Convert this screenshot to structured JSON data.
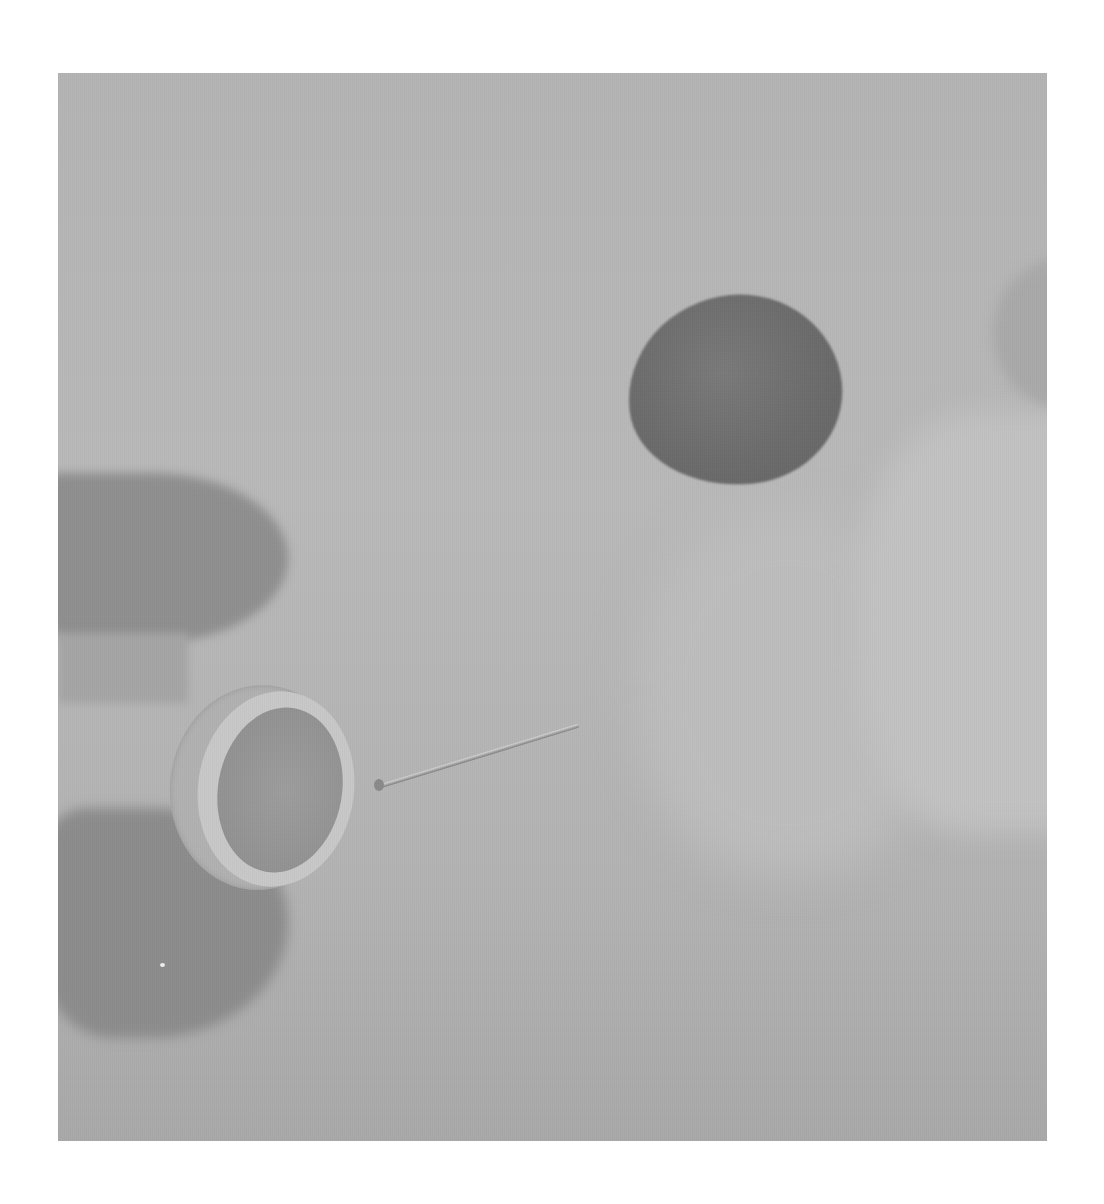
{
  "image": {
    "type": "grayscale-photograph",
    "description": "Fingers holding a small ring on the left, a straight pin lying nearby, a dark round disc at upper middle-right, and blurred fingers/hand on the right against a plain light background",
    "objects": [
      {
        "name": "ring",
        "position": "left-center"
      },
      {
        "name": "pin",
        "position": "center"
      },
      {
        "name": "dark-disc",
        "position": "upper-right-center"
      },
      {
        "name": "left-hand-fingers",
        "position": "left"
      },
      {
        "name": "right-hand-fingers",
        "position": "right"
      }
    ],
    "colors": {
      "page": "#ffffff",
      "background": "#b5b5b5",
      "disc": "#6c6c6c",
      "ring": "#c8c8c8",
      "fingers_left": "#8e8e8e"
    }
  }
}
